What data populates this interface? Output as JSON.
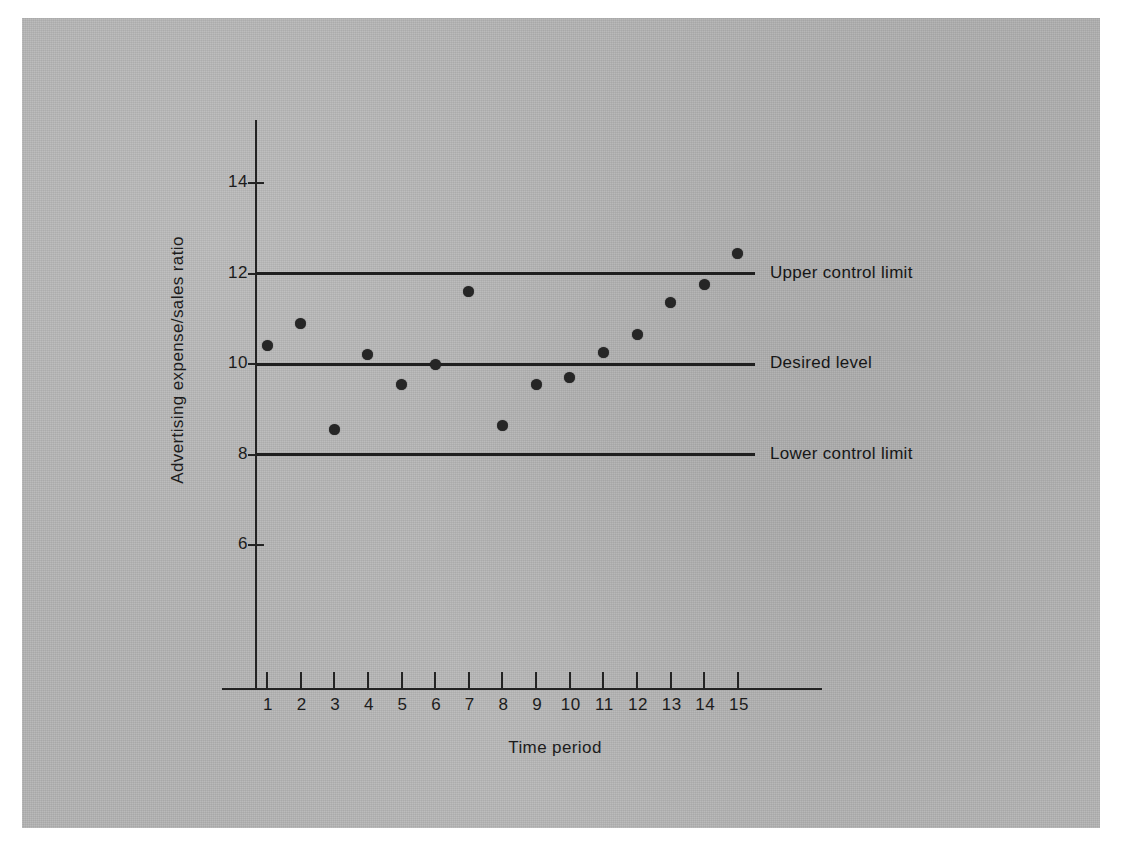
{
  "figure": {
    "panel_color": "#b2b2b2",
    "ink_color": "#232323"
  },
  "chart_data": {
    "type": "scatter",
    "title": "",
    "subtitle": "",
    "xlabel": "Time period",
    "ylabel": "Advertising expense/sales ratio",
    "x": [
      1,
      2,
      3,
      4,
      5,
      6,
      7,
      8,
      9,
      10,
      11,
      12,
      13,
      14,
      15
    ],
    "values": [
      10.4,
      10.9,
      8.55,
      10.2,
      9.55,
      10.0,
      11.6,
      8.65,
      9.55,
      9.7,
      10.25,
      10.65,
      11.35,
      11.75,
      12.45
    ],
    "series": [
      {
        "name": "Advertising expense/sales ratio",
        "values": [
          10.4,
          10.9,
          8.55,
          10.2,
          9.55,
          10.0,
          11.6,
          8.65,
          9.55,
          9.7,
          10.25,
          10.65,
          11.35,
          11.75,
          12.45
        ]
      }
    ],
    "xlim": [
      0,
      16
    ],
    "ylim": [
      4.2,
      15.2
    ],
    "xticks": [
      1,
      2,
      3,
      4,
      5,
      6,
      7,
      8,
      9,
      10,
      11,
      12,
      13,
      14,
      15
    ],
    "xticklabels": [
      "1",
      "2",
      "3",
      "4",
      "5",
      "6",
      "7",
      "8",
      "9",
      "10",
      "11",
      "12",
      "13",
      "14",
      "15"
    ],
    "yticks": [
      6,
      8,
      10,
      12,
      14
    ],
    "yticklabels": [
      "6",
      "8",
      "10",
      "12",
      "14"
    ],
    "grid": false,
    "legend_position": "right-inline-annotations",
    "reference_lines": [
      {
        "label": "Upper control limit",
        "value": 12
      },
      {
        "label": "Desired level",
        "value": 10
      },
      {
        "label": "Lower control limit",
        "value": 8
      }
    ],
    "annotations": [
      {
        "text": "Upper control limit",
        "y": 12
      },
      {
        "text": "Desired level",
        "y": 10
      },
      {
        "text": "Lower control limit",
        "y": 8
      }
    ],
    "marker": "filled-circle",
    "marker_color": "#262626"
  }
}
